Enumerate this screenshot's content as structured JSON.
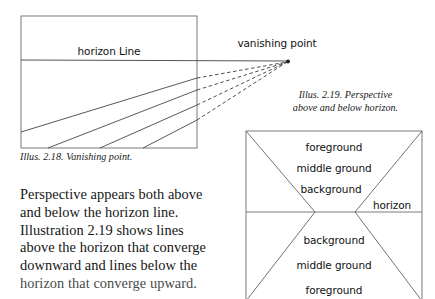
{
  "page": {
    "background_color": "#ffffff",
    "ink_color": "#1a1a1a",
    "line_color": "#555555"
  },
  "figure_218": {
    "id": "illus-2-18",
    "horizon_label": "horizon Line",
    "vanishing_point_label": "vanishing point",
    "caption": "Illus. 2.18. Vanishing point.",
    "geometry": {
      "frame": {
        "x": 21,
        "y": 16,
        "width": 176,
        "height": 132
      },
      "horizon_y": 60,
      "horizon_extends_to_x": 288,
      "vanishing_point": {
        "x": 288,
        "y": 62
      },
      "solid_lines": [
        {
          "x1": 21,
          "y1": 132,
          "x2": 197,
          "y2": 78
        },
        {
          "x1": 48,
          "y1": 148,
          "x2": 197,
          "y2": 90
        },
        {
          "x1": 100,
          "y1": 148,
          "x2": 197,
          "y2": 105
        },
        {
          "x1": 143,
          "y1": 148,
          "x2": 197,
          "y2": 120
        }
      ],
      "dashed_lines": [
        {
          "x1": 197,
          "y1": 78,
          "x2": 288,
          "y2": 62
        },
        {
          "x1": 197,
          "y1": 90,
          "x2": 288,
          "y2": 62
        },
        {
          "x1": 197,
          "y1": 105,
          "x2": 288,
          "y2": 62
        },
        {
          "x1": 197,
          "y1": 120,
          "x2": 288,
          "y2": 62
        }
      ]
    }
  },
  "figure_219": {
    "id": "illus-2-19",
    "caption": "Illus. 2.19. Perspective\nabove and below horizon.",
    "horizon_label": "horizon",
    "labels_above": [
      "foreground",
      "middle ground",
      "background"
    ],
    "labels_below": [
      "background",
      "middle ground",
      "foreground"
    ],
    "geometry": {
      "frame": {
        "x": 246,
        "y": 131,
        "width": 176,
        "height": 168
      },
      "horizon_y": 212,
      "left_node": {
        "x": 315,
        "y": 212
      },
      "right_node": {
        "x": 355,
        "y": 212
      },
      "label_rows_above_y": [
        148,
        169,
        190
      ],
      "horizon_label_pos": {
        "x": 392,
        "y": 207
      },
      "label_rows_below_y": [
        241,
        266,
        291
      ]
    }
  },
  "body": {
    "lines": [
      "Perspective appears both above",
      "and below the horizon line.",
      "Illustration 2.19 shows lines",
      "above the horizon that converge",
      "downward and lines below the"
    ],
    "clipped_line": "horizon that converge upward."
  }
}
